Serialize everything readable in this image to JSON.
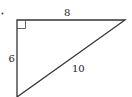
{
  "diagram": {
    "type": "right-triangle",
    "marker_dot": true,
    "right_angle_marker": true,
    "sides": {
      "top": {
        "label": "8"
      },
      "left": {
        "label": "6"
      },
      "hypotenuse": {
        "label": "10"
      }
    },
    "colors": {
      "stroke": "#333333",
      "marker": "#555555",
      "text": "#222222"
    }
  }
}
